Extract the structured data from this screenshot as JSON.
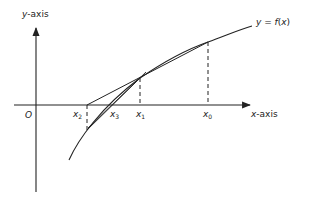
{
  "diagram": {
    "axes": {
      "y_label_var": "y",
      "y_label_suffix": "-axis",
      "x_label_var": "x",
      "x_label_suffix": "-axis",
      "origin": "O"
    },
    "curve_label": {
      "lhs": "y",
      "eq": " = ",
      "fn": "f",
      "arg_open": "(",
      "arg": "x",
      "arg_close": ")"
    },
    "points": [
      {
        "var": "x",
        "sub": "0"
      },
      {
        "var": "x",
        "sub": "1"
      },
      {
        "var": "x",
        "sub": "2"
      },
      {
        "var": "x",
        "sub": "3"
      }
    ],
    "colors": {
      "line": "#222222",
      "background": "#ffffff"
    }
  }
}
